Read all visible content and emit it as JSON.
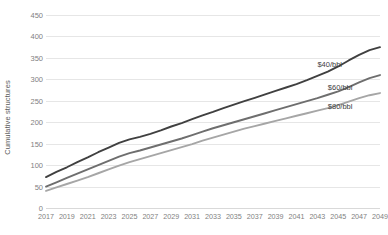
{
  "chart_data": {
    "type": "line",
    "title": "",
    "subtitle": "",
    "xlabel": "",
    "ylabel": "Cumulative structures",
    "xlim": [
      2017,
      2049
    ],
    "ylim": [
      0,
      450
    ],
    "ytick_step": 50,
    "grid": true,
    "grid_axis": "y",
    "legend_position": "inline-right",
    "background": "#ffffff",
    "gridline_color": "#e6e6e6",
    "tick_label_color": "#7f7f7f",
    "axis_label_color": "#595959",
    "yticks": [
      0,
      50,
      100,
      150,
      200,
      250,
      300,
      350,
      400,
      450
    ],
    "xticks": [
      2017,
      2019,
      2021,
      2023,
      2025,
      2027,
      2029,
      2031,
      2033,
      2035,
      2037,
      2039,
      2041,
      2043,
      2045,
      2047,
      2049
    ],
    "x": [
      2017,
      2018,
      2019,
      2020,
      2021,
      2022,
      2023,
      2024,
      2025,
      2026,
      2027,
      2028,
      2029,
      2030,
      2031,
      2032,
      2033,
      2034,
      2035,
      2036,
      2037,
      2038,
      2039,
      2040,
      2041,
      2042,
      2043,
      2044,
      2045,
      2046,
      2047,
      2048,
      2049
    ],
    "series": [
      {
        "name": "$40/bbl",
        "label": "$40/bbl",
        "color": "#404040",
        "width": 1.9,
        "label_x": 2043,
        "label_y": 330,
        "values": [
          72,
          84,
          95,
          107,
          118,
          130,
          141,
          152,
          160,
          166,
          173,
          181,
          190,
          198,
          207,
          216,
          224,
          233,
          241,
          249,
          257,
          265,
          273,
          281,
          289,
          298,
          308,
          318,
          330,
          344,
          357,
          368,
          375
        ]
      },
      {
        "name": "$60/bbl",
        "label": "$60/bbl",
        "color": "#6e6e6e",
        "width": 1.9,
        "label_x": 2044,
        "label_y": 278,
        "values": [
          50,
          60,
          70,
          80,
          90,
          100,
          110,
          120,
          128,
          134,
          141,
          148,
          155,
          162,
          170,
          178,
          186,
          193,
          200,
          207,
          214,
          221,
          228,
          235,
          242,
          249,
          256,
          264,
          272,
          282,
          293,
          303,
          310
        ]
      },
      {
        "name": "$80/bbl",
        "label": "$80/bbl",
        "color": "#a6a6a6",
        "width": 1.9,
        "label_x": 2044,
        "label_y": 232,
        "values": [
          40,
          48,
          56,
          64,
          72,
          81,
          90,
          99,
          107,
          114,
          121,
          128,
          135,
          142,
          149,
          157,
          164,
          171,
          178,
          185,
          191,
          197,
          203,
          209,
          215,
          221,
          227,
          233,
          240,
          248,
          256,
          263,
          268
        ]
      }
    ]
  }
}
